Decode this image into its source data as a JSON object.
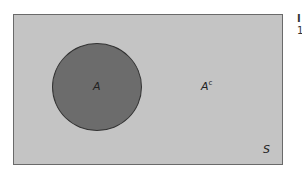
{
  "diagram": {
    "type": "venn",
    "sample_space_label": "S",
    "event_label": "A",
    "complement_label": "A",
    "complement_superscript": "c",
    "colors": {
      "sample_space_fill": "#c4c4c4",
      "event_fill": "#6c6c6c",
      "border": "#333333"
    }
  },
  "cropped_text": {
    "line1": "I",
    "line2": "1"
  }
}
